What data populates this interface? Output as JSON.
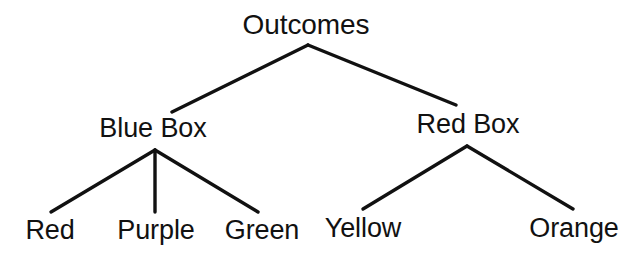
{
  "diagram": {
    "type": "tree",
    "title": "Outcomes",
    "background_color": "#ffffff",
    "line_color": "#111111",
    "text_color": "#111111",
    "root": {
      "label": "Outcomes"
    },
    "level2": [
      {
        "label": "Blue Box"
      },
      {
        "label": "Red Box"
      }
    ],
    "leaves_blue_box": [
      {
        "label": "Red"
      },
      {
        "label": "Purple"
      },
      {
        "label": "Green"
      }
    ],
    "leaves_red_box": [
      {
        "label": "Yellow"
      },
      {
        "label": "Orange"
      }
    ]
  }
}
